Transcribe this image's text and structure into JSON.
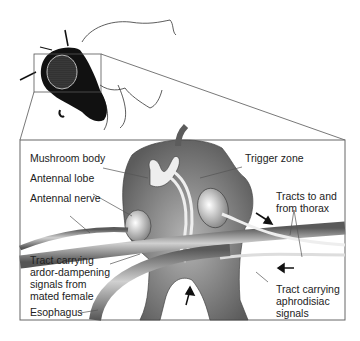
{
  "diagram": {
    "labels": {
      "mushroom_body": "Mushroom body",
      "antennal_lobe": "Antennal lobe",
      "antennal_nerve": "Antennal nerve",
      "trigger_zone": "Trigger zone",
      "tracts_thorax": "Tracts to and\nfrom thorax",
      "tract_ardor": "Tract carrying\nardor-dampening\nsignals from\nmated female",
      "esophagus": "Esophagus",
      "tract_aphrodisiac": "Tract carrying\naphrodisiac\nsignals"
    },
    "colors": {
      "brain_fill": "#6e6e6e",
      "brain_light": "#d8d8d8",
      "fly_body": "#111111",
      "outline": "#444444",
      "background": "#ffffff"
    }
  }
}
